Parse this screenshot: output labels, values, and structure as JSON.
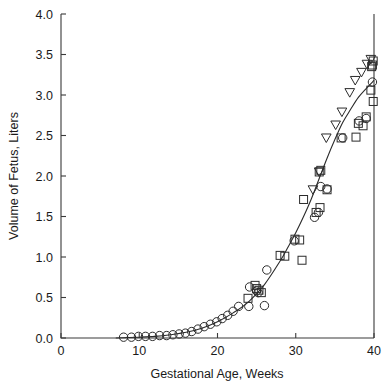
{
  "chart_data": {
    "type": "scatter",
    "title": "",
    "xlabel": "Gestational Age, Weeks",
    "ylabel": "Volume of Fetus, Liters",
    "xlim": [
      0,
      40
    ],
    "ylim": [
      0.0,
      4.0
    ],
    "xticks": [
      0,
      10,
      20,
      30,
      40
    ],
    "xtick_labels": [
      "0",
      "10",
      "20",
      "30",
      "40"
    ],
    "yticks": [
      0.0,
      0.5,
      1.0,
      1.5,
      2.0,
      2.5,
      3.0,
      3.5,
      4.0
    ],
    "ytick_labels": [
      "0.0",
      "0.5",
      "1.0",
      "1.5",
      "2.0",
      "2.5",
      "3.0",
      "3.5",
      "4.0"
    ],
    "grid": false,
    "legend": "none",
    "series": [
      {
        "name": "circles",
        "marker": "circle",
        "points": [
          [
            8.0,
            0.01
          ],
          [
            9.0,
            0.01
          ],
          [
            9.9,
            0.02
          ],
          [
            10.8,
            0.02
          ],
          [
            11.7,
            0.02
          ],
          [
            12.6,
            0.03
          ],
          [
            13.5,
            0.03
          ],
          [
            14.3,
            0.04
          ],
          [
            15.1,
            0.05
          ],
          [
            15.9,
            0.06
          ],
          [
            16.7,
            0.08
          ],
          [
            17.5,
            0.11
          ],
          [
            18.3,
            0.14
          ],
          [
            19.1,
            0.17
          ],
          [
            19.9,
            0.2
          ],
          [
            20.6,
            0.24
          ],
          [
            21.3,
            0.28
          ],
          [
            22.0,
            0.33
          ],
          [
            22.7,
            0.39
          ],
          [
            24.0,
            0.39
          ],
          [
            24.1,
            0.63
          ],
          [
            25.0,
            0.58
          ],
          [
            25.2,
            0.56
          ],
          [
            26.0,
            0.4
          ],
          [
            26.3,
            0.84
          ],
          [
            29.8,
            1.2
          ],
          [
            32.4,
            1.49
          ],
          [
            32.9,
            1.55
          ],
          [
            33.2,
            1.87
          ],
          [
            34.0,
            1.84
          ],
          [
            36.0,
            2.47
          ],
          [
            38.1,
            2.68
          ],
          [
            39.0,
            2.71
          ],
          [
            39.8,
            3.16
          ]
        ]
      },
      {
        "name": "squares",
        "marker": "square",
        "points": [
          [
            23.9,
            0.49
          ],
          [
            24.8,
            0.65
          ],
          [
            25.0,
            0.61
          ],
          [
            25.3,
            0.59
          ],
          [
            25.6,
            0.56
          ],
          [
            28.0,
            1.02
          ],
          [
            28.6,
            1.01
          ],
          [
            29.9,
            1.22
          ],
          [
            30.5,
            1.21
          ],
          [
            30.8,
            0.96
          ],
          [
            31.0,
            1.71
          ],
          [
            32.6,
            1.55
          ],
          [
            33.1,
            1.61
          ],
          [
            33.0,
            2.05
          ],
          [
            33.2,
            2.07
          ],
          [
            34.0,
            1.83
          ],
          [
            35.8,
            2.47
          ],
          [
            37.7,
            2.48
          ],
          [
            38.0,
            2.65
          ],
          [
            38.6,
            2.62
          ],
          [
            39.0,
            2.73
          ],
          [
            39.6,
            3.06
          ],
          [
            39.7,
            3.35
          ],
          [
            39.8,
            3.37
          ],
          [
            39.9,
            3.42
          ],
          [
            39.9,
            2.92
          ]
        ]
      },
      {
        "name": "triangles",
        "marker": "triangle-down",
        "points": [
          [
            32.2,
            1.83
          ],
          [
            33.0,
            2.05
          ],
          [
            33.9,
            2.47
          ],
          [
            35.1,
            2.63
          ],
          [
            35.9,
            2.79
          ],
          [
            36.9,
            3.03
          ],
          [
            37.6,
            3.18
          ],
          [
            38.4,
            3.28
          ],
          [
            39.1,
            3.38
          ],
          [
            39.6,
            3.44
          ]
        ]
      }
    ],
    "fit_curve": {
      "name": "fitted-growth-curve",
      "points": [
        [
          7.0,
          0.0
        ],
        [
          10.0,
          0.01
        ],
        [
          12.0,
          0.02
        ],
        [
          14.0,
          0.04
        ],
        [
          16.0,
          0.07
        ],
        [
          18.0,
          0.12
        ],
        [
          20.0,
          0.2
        ],
        [
          22.0,
          0.31
        ],
        [
          24.0,
          0.45
        ],
        [
          26.0,
          0.66
        ],
        [
          28.0,
          0.95
        ],
        [
          29.0,
          1.12
        ],
        [
          30.0,
          1.3
        ],
        [
          31.0,
          1.5
        ],
        [
          32.0,
          1.72
        ],
        [
          33.0,
          1.97
        ],
        [
          34.0,
          2.22
        ],
        [
          35.0,
          2.45
        ],
        [
          36.0,
          2.66
        ],
        [
          37.0,
          2.82
        ],
        [
          38.0,
          2.97
        ],
        [
          39.0,
          3.08
        ],
        [
          40.0,
          3.18
        ]
      ]
    }
  },
  "colors": {
    "axis": "#3a3a3a",
    "marker_stroke": "#2b2b2b",
    "curve": "#2b2b2b",
    "text": "#1a1a1a",
    "background": "#ffffff"
  }
}
